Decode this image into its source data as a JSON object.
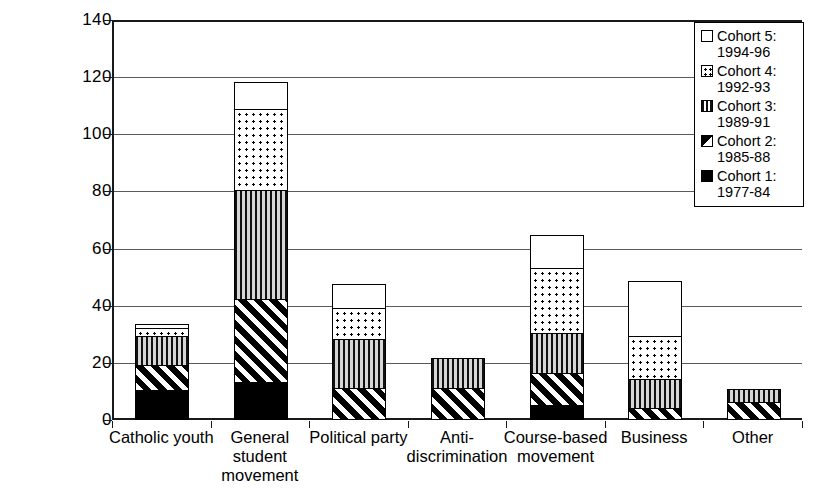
{
  "chart_data": {
    "type": "bar",
    "stacked": true,
    "title": "",
    "xlabel": "",
    "ylabel": "",
    "ylim": [
      0,
      140
    ],
    "ytick_step": 20,
    "yticks": [
      "0",
      "20",
      "40",
      "60",
      "80",
      "100",
      "120",
      "140"
    ],
    "grid": true,
    "grid_axis": "y",
    "legend_position": "top-right",
    "categories": [
      "Catholic youth",
      "General student movement",
      "Political party",
      "Anti-discrimination",
      "Course-based movement",
      "Business",
      "Other"
    ],
    "category_label_lines": [
      [
        "Catholic youth"
      ],
      [
        "General",
        "student",
        "movement"
      ],
      [
        "Political party"
      ],
      [
        "Anti-",
        "discrimination"
      ],
      [
        "Course-based",
        "movement"
      ],
      [
        "Business"
      ],
      [
        "Other"
      ]
    ],
    "series": [
      {
        "name": "Cohort 1: 1977-84",
        "pattern": "solid-black",
        "values": [
          10,
          13,
          0,
          0,
          5,
          0,
          0
        ]
      },
      {
        "name": "Cohort 2: 1985-88",
        "pattern": "diagonal-hatch",
        "values": [
          9,
          29,
          11,
          11,
          11,
          4,
          6
        ]
      },
      {
        "name": "Cohort 3: 1989-91",
        "pattern": "vertical-lines",
        "values": [
          10,
          38,
          17,
          10,
          14,
          10,
          4
        ]
      },
      {
        "name": "Cohort 4: 1992-93",
        "pattern": "dotted",
        "values": [
          3,
          28.5,
          11,
          0,
          23,
          15,
          0
        ]
      },
      {
        "name": "Cohort 5: 1994-96",
        "pattern": "white",
        "values": [
          1,
          9,
          8,
          0,
          11,
          19,
          0
        ]
      }
    ],
    "totals": [
      33,
      117.5,
      47,
      21,
      64,
      48,
      10
    ]
  },
  "legend": {
    "entries": [
      {
        "label_line1": "Cohort 5:",
        "label_line2": "1994-96",
        "pattern": "white"
      },
      {
        "label_line1": "Cohort 4:",
        "label_line2": "1992-93",
        "pattern": "dotted"
      },
      {
        "label_line1": "Cohort 3:",
        "label_line2": "1989-91",
        "pattern": "vertical-lines"
      },
      {
        "label_line1": "Cohort 2:",
        "label_line2": "1985-88",
        "pattern": "diagonal-hatch"
      },
      {
        "label_line1": "Cohort 1:",
        "label_line2": "1977-84",
        "pattern": "solid-black"
      }
    ]
  },
  "colors": {
    "axis": "#1a1a1a",
    "grid": "#5a5a5a",
    "fill_dark": "#000000",
    "background": "#ffffff"
  }
}
